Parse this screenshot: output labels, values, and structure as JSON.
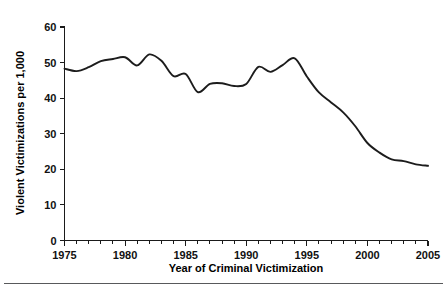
{
  "chart_data": {
    "type": "line",
    "title": "",
    "xlabel": "Year of Criminal Victimization",
    "ylabel": "Violent Victimizations per 1,000",
    "xlim": [
      1975,
      2005
    ],
    "ylim": [
      0,
      60
    ],
    "grid": false,
    "legend": null,
    "x_tick_labels": [
      "1975",
      "1980",
      "1985",
      "1990",
      "1995",
      "2000",
      "2005"
    ],
    "x_major_ticks": [
      1975,
      1980,
      1985,
      1990,
      1995,
      2000,
      2005
    ],
    "x_minor_tick_step": 1,
    "y_tick_labels": [
      "0",
      "10",
      "20",
      "30",
      "40",
      "50",
      "60"
    ],
    "y_major_ticks": [
      0,
      10,
      20,
      30,
      40,
      50,
      60
    ],
    "line_color": "#1c1c1c",
    "x": [
      1975,
      1976,
      1977,
      1978,
      1979,
      1980,
      1981,
      1982,
      1983,
      1984,
      1985,
      1986,
      1987,
      1988,
      1989,
      1990,
      1991,
      1992,
      1993,
      1994,
      1995,
      1996,
      1997,
      1998,
      1999,
      2000,
      2001,
      2002,
      2003,
      2004,
      2005
    ],
    "values": [
      48.3,
      47.6,
      48.7,
      50.4,
      51.0,
      51.5,
      49.2,
      52.3,
      50.5,
      46.2,
      46.8,
      41.7,
      44.0,
      44.2,
      43.4,
      44.0,
      48.8,
      47.4,
      49.3,
      51.2,
      46.1,
      41.6,
      38.8,
      36.0,
      32.1,
      27.4,
      24.7,
      22.8,
      22.3,
      21.4,
      21.0
    ]
  },
  "figure": {
    "footer_rule": true
  }
}
